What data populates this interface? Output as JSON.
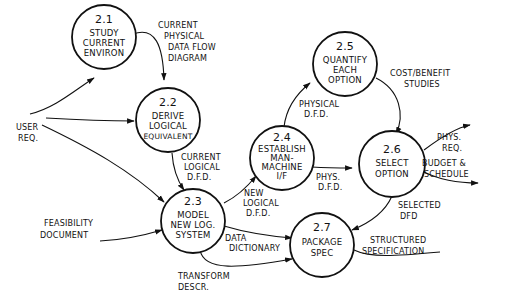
{
  "diagram": {
    "type": "data-flow-diagram",
    "processes": [
      {
        "id": "2.1",
        "lines": [
          "STUDY",
          "CURRENT",
          "ENVIRON"
        ]
      },
      {
        "id": "2.2",
        "lines": [
          "DERIVE",
          "LOGICAL",
          "EQUIVALENT"
        ]
      },
      {
        "id": "2.3",
        "lines": [
          "MODEL",
          "NEW LOG.",
          "SYSTEM"
        ]
      },
      {
        "id": "2.4",
        "lines": [
          "ESTABLISH",
          "MAN-",
          "MACHINE",
          "I/F"
        ]
      },
      {
        "id": "2.5",
        "lines": [
          "QUANTIFY",
          "EACH",
          "OPTION"
        ]
      },
      {
        "id": "2.6",
        "lines": [
          "SELECT",
          "OPTION"
        ]
      },
      {
        "id": "2.7",
        "lines": [
          "PACKAGE",
          "SPEC"
        ]
      }
    ],
    "external_inputs": {
      "user_req": [
        "USER",
        "REQ."
      ],
      "feasibility": [
        "FEASIBILITY",
        "DOCUMENT"
      ]
    },
    "flows": {
      "current_physical_dfd": [
        "CURRENT",
        "PHYSICAL",
        "DATA FLOW",
        "DIAGRAM"
      ],
      "current_logical_dfd": [
        "CURRENT",
        "LOGICAL",
        "D.F.D."
      ],
      "new_logical_dfd": [
        "NEW",
        "LOGICAL",
        "D.F.D."
      ],
      "physical_dfd": [
        "PHYSICAL",
        "D.F.D."
      ],
      "cost_benefit": [
        "COST/BENEFIT",
        "STUDIES"
      ],
      "phys_dfd": [
        "PHYS.",
        "D.F.D."
      ],
      "phys_req": [
        "PHYS.",
        "REQ."
      ],
      "budget_schedule": [
        "BUDGET &",
        "SCHEDULE"
      ],
      "selected_dfd": [
        "SELECTED",
        "DFD"
      ],
      "data_dictionary": [
        "DATA",
        "DICTIONARY"
      ],
      "transform_descr": [
        "TRANSFORM",
        "DESCR."
      ],
      "structured_spec": [
        "STRUCTURED",
        "SPECIFICATION"
      ]
    }
  }
}
